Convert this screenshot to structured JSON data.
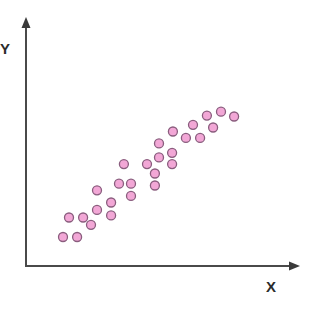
{
  "chart_data": {
    "type": "scatter",
    "title": "",
    "xlabel": "X",
    "ylabel": "Y",
    "grid": false,
    "legend": null,
    "ticks": {
      "x": [],
      "y": []
    },
    "xlim": [
      0,
      100
    ],
    "ylim": [
      0,
      100
    ],
    "marker": {
      "shape": "circle",
      "fill": "#f2a7d6",
      "stroke": "#8a5d7e",
      "radius": 4.5
    },
    "trend": "positive linear correlation",
    "points": [
      {
        "x": 13.6,
        "y": 12.6
      },
      {
        "x": 18.8,
        "y": 12.6
      },
      {
        "x": 15.8,
        "y": 21.1
      },
      {
        "x": 21.0,
        "y": 21.1
      },
      {
        "x": 23.9,
        "y": 17.9
      },
      {
        "x": 26.1,
        "y": 24.4
      },
      {
        "x": 26.1,
        "y": 32.9
      },
      {
        "x": 31.3,
        "y": 27.6
      },
      {
        "x": 31.3,
        "y": 22.0
      },
      {
        "x": 34.2,
        "y": 35.8
      },
      {
        "x": 36.0,
        "y": 44.3
      },
      {
        "x": 38.6,
        "y": 35.8
      },
      {
        "x": 38.6,
        "y": 30.5
      },
      {
        "x": 44.5,
        "y": 44.3
      },
      {
        "x": 47.4,
        "y": 40.2
      },
      {
        "x": 47.4,
        "y": 35.0
      },
      {
        "x": 48.9,
        "y": 47.2
      },
      {
        "x": 48.9,
        "y": 53.3
      },
      {
        "x": 53.7,
        "y": 49.2
      },
      {
        "x": 53.7,
        "y": 44.3
      },
      {
        "x": 54.0,
        "y": 58.5
      },
      {
        "x": 58.8,
        "y": 55.7
      },
      {
        "x": 61.4,
        "y": 61.4
      },
      {
        "x": 64.0,
        "y": 55.7
      },
      {
        "x": 66.5,
        "y": 65.4
      },
      {
        "x": 68.8,
        "y": 60.2
      },
      {
        "x": 71.7,
        "y": 67.1
      },
      {
        "x": 76.5,
        "y": 65.0
      }
    ]
  },
  "axes": {
    "x_label": "X",
    "y_label": "Y",
    "color": "#4a4a4a"
  }
}
